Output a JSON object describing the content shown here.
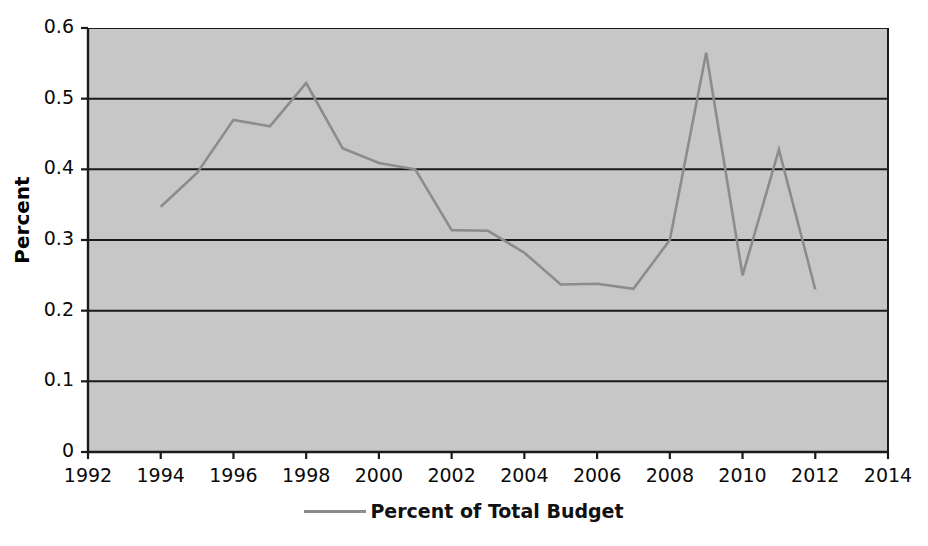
{
  "chart_data": {
    "type": "line",
    "title": "",
    "xlabel": "",
    "ylabel": "Percent",
    "xlim": [
      1992,
      2014
    ],
    "ylim": [
      0,
      0.6
    ],
    "x_tick_labels": [
      "1992",
      "1994",
      "1996",
      "1998",
      "2000",
      "2002",
      "2004",
      "2006",
      "2008",
      "2010",
      "2012",
      "2014"
    ],
    "x_ticks": [
      1992,
      1994,
      1996,
      1998,
      2000,
      2002,
      2004,
      2006,
      2008,
      2010,
      2012,
      2014
    ],
    "y_tick_labels": [
      "0",
      "0.1",
      "0.2",
      "0.3",
      "0.4",
      "0.5",
      "0.6"
    ],
    "y_ticks": [
      0,
      0.1,
      0.2,
      0.3,
      0.4,
      0.5,
      0.6
    ],
    "grid": "horizontal",
    "legend_position": "bottom",
    "plot_background": "#c7c7c7",
    "line_color": "#8c8c8c",
    "series": [
      {
        "name": "Percent of Total Budget",
        "x": [
          1994,
          1995,
          1996,
          1997,
          1998,
          1999,
          2000,
          2001,
          2002,
          2003,
          2004,
          2005,
          2006,
          2007,
          2008,
          2009,
          2010,
          2011,
          2012
        ],
        "values": [
          0.347,
          0.395,
          0.47,
          0.461,
          0.522,
          0.43,
          0.409,
          0.4,
          0.314,
          0.313,
          0.282,
          0.237,
          0.238,
          0.231,
          0.3,
          0.565,
          0.25,
          0.428,
          0.23
        ]
      }
    ]
  },
  "axes": {
    "y_title": "Percent"
  },
  "legend": {
    "entries": [
      {
        "label": "Percent of Total Budget",
        "color": "#8c8c8c",
        "marker": "line-swatch"
      }
    ]
  }
}
